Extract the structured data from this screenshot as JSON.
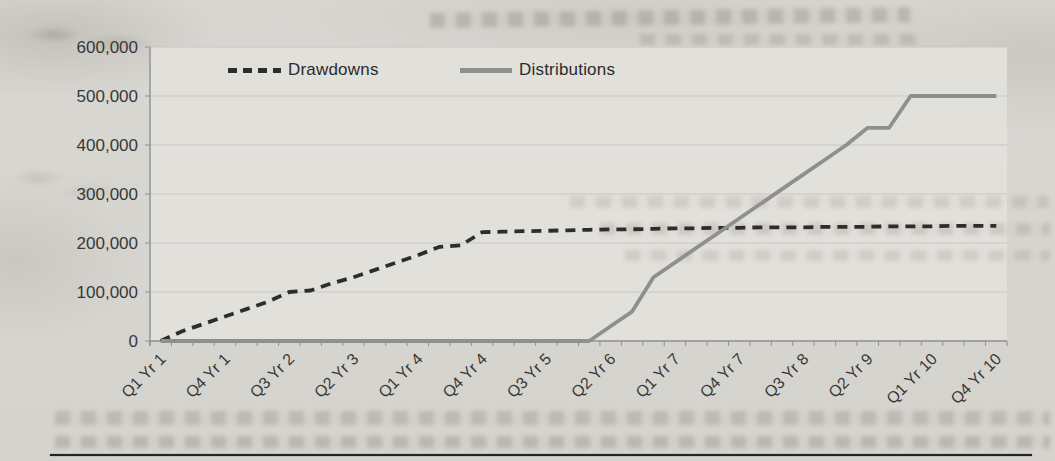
{
  "chart_data": {
    "type": "line",
    "title": "",
    "xlabel": "",
    "ylabel": "",
    "grid": "horizontal",
    "legend_position": "top-inside",
    "ylim": [
      0,
      600000
    ],
    "y_axis": {
      "min": 0,
      "max": 600000,
      "tick_step": 100000,
      "tick_labels": [
        "0",
        "100,000",
        "200,000",
        "300,000",
        "400,000",
        "500,000",
        "600,000"
      ]
    },
    "categories": [
      "Q1 Yr 1",
      "Q2 Yr 1",
      "Q3 Yr 1",
      "Q4 Yr 1",
      "Q1 Yr 2",
      "Q2 Yr 2",
      "Q3 Yr 2",
      "Q4 Yr 2",
      "Q1 Yr 3",
      "Q2 Yr 3",
      "Q3 Yr 3",
      "Q4 Yr 3",
      "Q1 Yr 4",
      "Q2 Yr 4",
      "Q3 Yr 4",
      "Q4 Yr 4",
      "Q1 Yr 5",
      "Q2 Yr 5",
      "Q3 Yr 5",
      "Q4 Yr 5",
      "Q1 Yr 6",
      "Q2 Yr 6",
      "Q3 Yr 6",
      "Q4 Yr 6",
      "Q1 Yr 7",
      "Q2 Yr 7",
      "Q3 Yr 7",
      "Q4 Yr 7",
      "Q1 Yr 8",
      "Q2 Yr 8",
      "Q3 Yr 8",
      "Q4 Yr 8",
      "Q1 Yr 9",
      "Q2 Yr 9",
      "Q3 Yr 9",
      "Q4 Yr 9",
      "Q1 Yr 10",
      "Q2 Yr 10",
      "Q3 Yr 10",
      "Q4 Yr 10"
    ],
    "shown_x_tick_labels": [
      "Q1 Yr 1",
      "Q4 Yr 1",
      "Q3 Yr 2",
      "Q2 Yr 3",
      "Q1 Yr 4",
      "Q4 Yr 4",
      "Q3 Yr 5",
      "Q2 Yr 6",
      "Q1 Yr 7",
      "Q4 Yr 7",
      "Q3 Yr 8",
      "Q2 Yr 9",
      "Q1 Yr 10",
      "Q4 Yr 10"
    ],
    "series": [
      {
        "name": "Drawdowns",
        "line_style": "dashed",
        "color": "#2d2d2d",
        "values": [
          0,
          20000,
          35000,
          50000,
          65000,
          80000,
          100000,
          103000,
          118000,
          130000,
          145000,
          160000,
          175000,
          192000,
          195000,
          222000,
          223000,
          224000,
          225000,
          226000,
          227000,
          228000,
          228000,
          229000,
          230000,
          230000,
          231000,
          231000,
          232000,
          232000,
          232000,
          233000,
          233000,
          233000,
          234000,
          234000,
          234000,
          235000,
          235000,
          235000
        ]
      },
      {
        "name": "Distributions",
        "line_style": "solid",
        "color": "#8f8f8f",
        "values": [
          0,
          0,
          0,
          0,
          0,
          0,
          0,
          0,
          0,
          0,
          0,
          0,
          0,
          0,
          0,
          0,
          0,
          0,
          0,
          0,
          0,
          30000,
          60000,
          130000,
          160000,
          190000,
          220000,
          250000,
          280000,
          310000,
          340000,
          370000,
          400000,
          435000,
          435000,
          500000,
          500000,
          500000,
          500000,
          500000
        ]
      }
    ]
  },
  "style": {
    "page_bg": "#d7d5d0",
    "plot_bg": "#e2e0db",
    "gridline_color": "#c9c7c2",
    "axis_color": "#8f8f8f",
    "tick_label_color": "#383838",
    "legend_text_color": "#2b2b2b",
    "bottom_rule_color": "#242424"
  }
}
